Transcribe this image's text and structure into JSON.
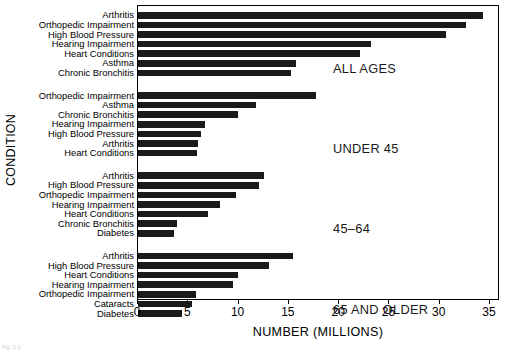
{
  "chart_data": {
    "type": "bar",
    "orientation": "horizontal",
    "title": "",
    "xlabel": "NUMBER (MILLIONS)",
    "ylabel": "CONDITION",
    "xlim": [
      0,
      35
    ],
    "xticks": [
      0,
      5,
      10,
      15,
      20,
      25,
      30,
      35
    ],
    "xtick_labels": [
      "0",
      "5",
      "10",
      "15",
      "20",
      "25",
      "30",
      "35"
    ],
    "grid": false,
    "legend": "none",
    "bar_color": "#1a1a1a",
    "groups": [
      {
        "name": "ALL AGES",
        "annotation": "ALL AGES",
        "categories": [
          "Arthritis",
          "Orthopedic Impairment",
          "High Blood Pressure",
          "Hearing Impairment",
          "Heart Conditions",
          "Asthma",
          "Chronic Bronchitis"
        ],
        "values": [
          34.3,
          32.6,
          30.6,
          23.2,
          22.1,
          15.7,
          15.2
        ]
      },
      {
        "name": "UNDER 45",
        "annotation": "UNDER 45",
        "categories": [
          "Orthopedic Impairment",
          "Asthma",
          "Chronic Bronchitis",
          "Hearing Impairment",
          "High Blood Pressure",
          "Arthritis",
          "Heart Conditions"
        ],
        "values": [
          17.7,
          11.7,
          9.9,
          6.7,
          6.3,
          6.0,
          5.9
        ]
      },
      {
        "name": "45-64",
        "annotation": "45–64",
        "categories": [
          "Arthritis",
          "High Blood Pressure",
          "Orthopedic Impairment",
          "Hearing Impairment",
          "Heart Conditions",
          "Chronic Bronchitis",
          "Diabetes"
        ],
        "values": [
          12.5,
          12.0,
          9.7,
          8.2,
          7.0,
          3.9,
          3.6
        ]
      },
      {
        "name": "65 AND OLDER",
        "annotation": "65 AND OLDER",
        "categories": [
          "Arthritis",
          "High Blood Pressure",
          "Heart Conditions",
          "Hearing Impairment",
          "Orthopedic Impairment",
          "Cataracts",
          "Diabetes"
        ],
        "values": [
          15.4,
          13.0,
          9.9,
          9.4,
          5.8,
          5.4,
          4.4
        ]
      }
    ]
  },
  "axis": {
    "x_title": "NUMBER (MILLIONS)",
    "y_title": "CONDITION"
  },
  "caption": "Fig. 2-1"
}
